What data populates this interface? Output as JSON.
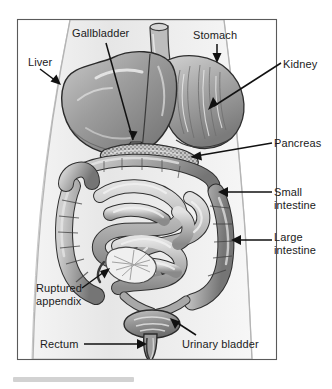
{
  "figure": {
    "style": "grayscale medical illustration",
    "frame": {
      "x": 17,
      "y": 19,
      "width": 260,
      "height": 341,
      "border_color": "#555555"
    },
    "background_color": "#ffffff",
    "body_outline_color": "#e8e8e8"
  },
  "labels": [
    {
      "id": "gallbladder",
      "text": "Gallbladder",
      "x": 72,
      "y": 27,
      "lines": [
        "Gallbladder"
      ]
    },
    {
      "id": "stomach",
      "text": "Stomach",
      "x": 193,
      "y": 29,
      "lines": [
        "Stomach"
      ]
    },
    {
      "id": "liver",
      "text": "Liver",
      "x": 28,
      "y": 56,
      "lines": [
        "Liver"
      ]
    },
    {
      "id": "kidney",
      "text": "Kidney",
      "x": 283,
      "y": 58,
      "lines": [
        "Kidney"
      ]
    },
    {
      "id": "pancreas",
      "text": "Pancreas",
      "x": 274,
      "y": 137,
      "lines": [
        "Pancreas"
      ]
    },
    {
      "id": "small-intestine",
      "text": "Small intestine",
      "x": 274,
      "y": 186,
      "lines": [
        "Small",
        "intestine"
      ]
    },
    {
      "id": "large-intestine",
      "text": "Large intestine",
      "x": 274,
      "y": 231,
      "lines": [
        "Large",
        "intestine"
      ]
    },
    {
      "id": "ruptured-appendix",
      "text": "Ruptured appendix",
      "x": 36,
      "y": 282,
      "lines": [
        "Ruptured",
        "appendix"
      ]
    },
    {
      "id": "rectum",
      "text": "Rectum",
      "x": 40,
      "y": 338,
      "lines": [
        "Rectum"
      ]
    },
    {
      "id": "urinary-bladder",
      "text": "Urinary bladder",
      "x": 182,
      "y": 338,
      "lines": [
        "Urinary bladder"
      ]
    }
  ],
  "organs": [
    {
      "id": "liver",
      "name": "Liver",
      "tone": "#9a9a9a"
    },
    {
      "id": "stomach",
      "name": "Stomach",
      "tone": "#a6a6a6"
    },
    {
      "id": "gallbladder",
      "name": "Gallbladder",
      "tone": "#8d8d8d"
    },
    {
      "id": "esophagus",
      "name": "Esophagus",
      "tone": "#b4b4b4"
    },
    {
      "id": "kidney",
      "name": "Kidney",
      "tone": "#8a8a8a"
    },
    {
      "id": "pancreas",
      "name": "Pancreas",
      "tone": "#c2c2c2"
    },
    {
      "id": "small-intestine",
      "name": "Small intestine",
      "tone": "#b8b8b8"
    },
    {
      "id": "large-intestine",
      "name": "Large intestine",
      "tone": "#a0a0a0"
    },
    {
      "id": "ruptured-appendix",
      "name": "Ruptured appendix",
      "tone": "#ededed"
    },
    {
      "id": "urinary-bladder",
      "name": "Urinary bladder",
      "tone": "#8f8f8f"
    },
    {
      "id": "rectum",
      "name": "Rectum",
      "tone": "#9d9d9d"
    }
  ],
  "caption_bar": {
    "visible": true,
    "color": "#d2d2d2"
  }
}
